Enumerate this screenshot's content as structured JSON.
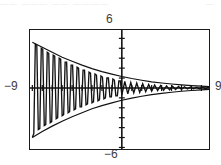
{
  "figure": {
    "kind": "graphing-calculator-plot",
    "top_remnant_left": "——  ———  ——   ————",
    "top_remnant_right": "—"
  },
  "labels": {
    "y_max": "6",
    "y_min": "−6",
    "x_min": "−9",
    "x_max": "9"
  },
  "colors": {
    "frame": "#1a1a1a",
    "curve": "#111111",
    "envelope": "#111111",
    "axis": "#111111",
    "label_text": "#3c3c3c",
    "background": "#ffffff"
  },
  "chart_data": {
    "type": "line",
    "title": "",
    "xlabel": "",
    "ylabel": "",
    "xlim": [
      -9,
      9
    ],
    "ylim": [
      -6,
      6
    ],
    "grid": false,
    "legend": null,
    "axes": {
      "x_axis_at_y": 0,
      "y_axis_at_x": 0,
      "x_tick_step": 1,
      "y_tick_step": 1,
      "x_axis_screen_y": 0.487,
      "y_axis_screen_x": 0.513
    },
    "series": [
      {
        "name": "damped oscillation",
        "style": "piecewise-linear-stepped",
        "x": [
          -9.0,
          -8.85,
          -8.7,
          -8.55,
          -8.4,
          -8.25,
          -8.1,
          -7.95,
          -7.8,
          -7.65,
          -7.5,
          -7.35,
          -7.2,
          -7.05,
          -6.9,
          -6.75,
          -6.6,
          -6.45,
          -6.3,
          -6.15,
          -6.0,
          -5.85,
          -5.7,
          -5.55,
          -5.4,
          -5.25,
          -5.1,
          -4.95,
          -4.8,
          -4.65,
          -4.5,
          -4.35,
          -4.2,
          -4.05,
          -3.9,
          -3.75,
          -3.6,
          -3.45,
          -3.3,
          -3.15,
          -3.0,
          -2.85,
          -2.7,
          -2.55,
          -2.4,
          -2.25,
          -2.1,
          -1.95,
          -1.8,
          -1.65,
          -1.5,
          -1.35,
          -1.2,
          -1.05,
          -0.9,
          -0.75,
          -0.6,
          -0.45,
          -0.3,
          -0.15,
          0.0,
          0.3,
          0.6,
          0.9,
          1.2,
          1.5,
          1.8,
          2.1,
          2.4,
          2.7,
          3.0,
          3.3,
          3.6,
          3.9,
          4.2,
          4.5,
          4.8,
          5.1,
          5.4,
          5.7,
          6.0,
          6.3,
          6.6,
          6.9,
          7.2,
          7.5,
          7.8,
          8.1,
          8.4,
          8.7,
          9.0
        ],
        "y": [
          -5.0,
          -4.6,
          4.4,
          4.3,
          -4.2,
          -4.1,
          4.0,
          3.9,
          -3.8,
          -3.7,
          3.6,
          3.5,
          -3.5,
          -3.4,
          3.3,
          3.2,
          -3.1,
          -3.0,
          3.0,
          2.9,
          -2.8,
          -2.7,
          2.6,
          2.6,
          -2.5,
          -2.4,
          2.3,
          2.3,
          -2.2,
          -2.1,
          2.1,
          2.0,
          -1.9,
          -1.9,
          1.8,
          1.8,
          -1.7,
          -1.6,
          1.6,
          1.5,
          -1.5,
          -1.4,
          1.4,
          1.3,
          -1.3,
          -1.2,
          1.2,
          1.1,
          -1.1,
          -1.0,
          1.0,
          1.0,
          -0.9,
          -0.9,
          0.9,
          0.8,
          -0.8,
          -0.8,
          0.7,
          0.7,
          -0.7,
          0.65,
          -0.6,
          0.55,
          -0.5,
          0.5,
          -0.45,
          0.42,
          -0.38,
          0.35,
          -0.32,
          0.3,
          -0.27,
          0.25,
          -0.23,
          0.21,
          -0.19,
          0.17,
          -0.16,
          0.15,
          -0.13,
          0.12,
          -0.11,
          0.1,
          -0.09,
          0.08,
          -0.075,
          0.07,
          -0.06,
          0.06,
          -0.05
        ]
      },
      {
        "name": "upper envelope",
        "style": "smooth-decay",
        "x": [
          -9.0,
          -8.0,
          -7.0,
          -6.0,
          -5.0,
          -4.0,
          -3.0,
          -2.0,
          -1.0,
          0.0,
          1.0,
          2.0,
          3.0,
          4.0,
          5.0,
          6.0,
          7.0,
          8.0,
          9.0
        ],
        "y": [
          4.6,
          4.1,
          3.6,
          3.1,
          2.7,
          2.3,
          1.95,
          1.65,
          1.4,
          1.15,
          0.95,
          0.78,
          0.62,
          0.5,
          0.4,
          0.31,
          0.24,
          0.18,
          0.13
        ]
      },
      {
        "name": "lower envelope",
        "style": "smooth-decay",
        "x": [
          -9.0,
          -8.0,
          -7.0,
          -6.0,
          -5.0,
          -4.0,
          -3.0,
          -2.0,
          -1.0,
          0.0,
          1.0,
          2.0,
          3.0,
          4.0,
          5.0,
          6.0,
          7.0,
          8.0,
          9.0
        ],
        "y": [
          -5.0,
          -4.4,
          -3.85,
          -3.35,
          -2.9,
          -2.5,
          -2.1,
          -1.78,
          -1.5,
          -1.24,
          -1.02,
          -0.84,
          -0.67,
          -0.54,
          -0.43,
          -0.33,
          -0.26,
          -0.19,
          -0.14
        ]
      }
    ]
  }
}
